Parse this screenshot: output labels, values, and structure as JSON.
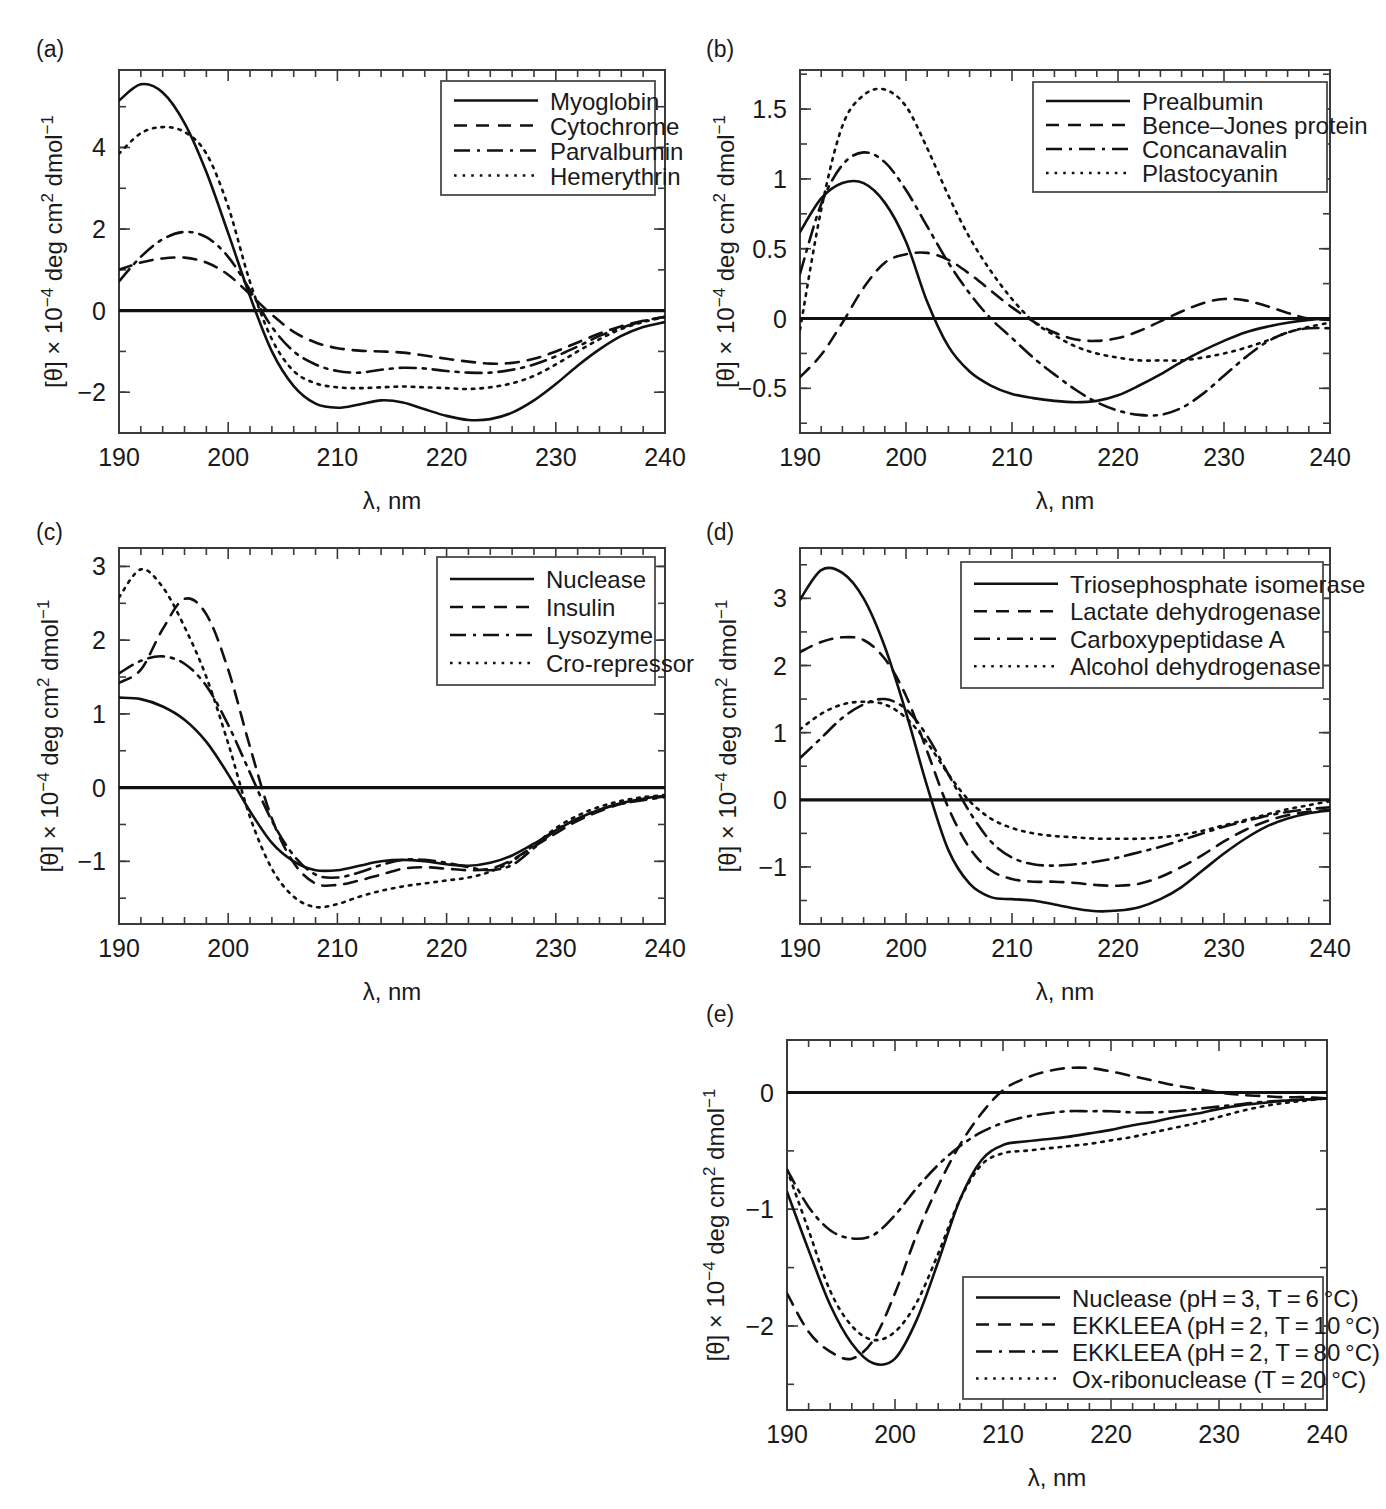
{
  "figure": {
    "axis": {
      "xlabel": "λ, nm",
      "ylabel_prefix": "[θ] × 10",
      "ylabel_exp": "−4",
      "ylabel_suffix": " deg cm",
      "ylabel_sq": "2",
      "ylabel_tail": " dmol",
      "ylabel_tailexp": "−1",
      "xticks": [
        "190",
        "200",
        "210",
        "220",
        "230",
        "240"
      ],
      "xlim": [
        190,
        240
      ]
    },
    "panels": [
      {
        "tag": "(a)",
        "yticks": [
          "4",
          "2",
          "0",
          "−2"
        ],
        "ytickvals": [
          4,
          2,
          0,
          -2
        ],
        "ylim": [
          -3.0,
          5.9
        ],
        "legend": [
          {
            "label": "Myoglobin",
            "style": "solid"
          },
          {
            "label": "Cytochrome",
            "style": "dashed"
          },
          {
            "label": "Parvalbumin",
            "style": "dashdot"
          },
          {
            "label": "Hemerythrin",
            "style": "dotted"
          }
        ]
      },
      {
        "tag": "(b)",
        "yticks": [
          "1.5",
          "1",
          "0.5",
          "0",
          "−0.5"
        ],
        "ytickvals": [
          1.5,
          1,
          0.5,
          0,
          -0.5
        ],
        "ylim": [
          -0.82,
          1.78
        ],
        "legend": [
          {
            "label": "Prealbumin",
            "style": "solid"
          },
          {
            "label": "Bence–Jones protein",
            "style": "dashed"
          },
          {
            "label": "Concanavalin",
            "style": "dashdot"
          },
          {
            "label": "Plastocyanin",
            "style": "dotted"
          }
        ]
      },
      {
        "tag": "(c)",
        "yticks": [
          "3",
          "2",
          "1",
          "0",
          "−1"
        ],
        "ytickvals": [
          3,
          2,
          1,
          0,
          -1
        ],
        "ylim": [
          -1.85,
          3.25
        ],
        "legend": [
          {
            "label": "Nuclease",
            "style": "solid"
          },
          {
            "label": "Insulin",
            "style": "dashed"
          },
          {
            "label": "Lysozyme",
            "style": "dashdot"
          },
          {
            "label": "Cro-repressor",
            "style": "dotted"
          }
        ]
      },
      {
        "tag": "(d)",
        "yticks": [
          "3",
          "2",
          "1",
          "0",
          "−1"
        ],
        "ytickvals": [
          3,
          2,
          1,
          0,
          -1
        ],
        "ylim": [
          -1.85,
          3.75
        ],
        "legend": [
          {
            "label": "Triosephosphate isomerase",
            "style": "solid"
          },
          {
            "label": "Lactate dehydrogenase",
            "style": "dashed"
          },
          {
            "label": "Carboxypeptidase A",
            "style": "dashdot"
          },
          {
            "label": "Alcohol dehydrogenase",
            "style": "dotted"
          }
        ]
      },
      {
        "tag": "(e)",
        "yticks": [
          "0",
          "−1",
          "−2"
        ],
        "ytickvals": [
          0,
          -1,
          -2
        ],
        "ylim": [
          -2.72,
          0.45
        ],
        "legend": [
          {
            "label": "Nuclease (pH = 3, T = 6 °C)",
            "style": "solid"
          },
          {
            "label": "EKKLEEA (pH = 2, T = 10 °C)",
            "style": "dashed"
          },
          {
            "label": "EKKLEEA (pH = 2, T = 80 °C)",
            "style": "dashdot"
          },
          {
            "label": "Ox-ribonuclease (T = 20 °C)",
            "style": "dotted"
          }
        ]
      }
    ]
  },
  "chart_data": [
    {
      "type": "line",
      "panel": "(a)",
      "title": "",
      "xlabel": "λ, nm",
      "ylabel": "[θ] × 10⁻⁴ deg cm² dmol⁻¹",
      "xlim": [
        190,
        240
      ],
      "ylim": [
        -3.0,
        5.9
      ],
      "grid": false,
      "legend_position": "top-right",
      "x": [
        190,
        192,
        194,
        196,
        198,
        200,
        202,
        204,
        206,
        208,
        210,
        212,
        214,
        216,
        218,
        220,
        222,
        224,
        226,
        228,
        230,
        232,
        234,
        236,
        238,
        240
      ],
      "series": [
        {
          "name": "Myoglobin",
          "style": "solid",
          "values": [
            5.15,
            5.55,
            5.35,
            4.6,
            3.4,
            1.9,
            0.35,
            -1.0,
            -1.85,
            -2.28,
            -2.38,
            -2.3,
            -2.2,
            -2.25,
            -2.42,
            -2.58,
            -2.68,
            -2.66,
            -2.5,
            -2.2,
            -1.8,
            -1.35,
            -0.95,
            -0.62,
            -0.4,
            -0.28
          ]
        },
        {
          "name": "Cytochrome",
          "style": "dashed",
          "values": [
            1.0,
            1.18,
            1.28,
            1.3,
            1.18,
            0.88,
            0.4,
            -0.1,
            -0.52,
            -0.78,
            -0.92,
            -0.98,
            -1.0,
            -1.03,
            -1.1,
            -1.18,
            -1.25,
            -1.3,
            -1.28,
            -1.18,
            -1.0,
            -0.78,
            -0.56,
            -0.38,
            -0.25,
            -0.15
          ]
        },
        {
          "name": "Parvalbumin",
          "style": "dashdot",
          "values": [
            0.72,
            1.32,
            1.75,
            1.93,
            1.8,
            1.32,
            0.5,
            -0.4,
            -1.0,
            -1.32,
            -1.48,
            -1.52,
            -1.45,
            -1.4,
            -1.42,
            -1.48,
            -1.52,
            -1.52,
            -1.45,
            -1.32,
            -1.12,
            -0.88,
            -0.62,
            -0.42,
            -0.26,
            -0.15
          ]
        },
        {
          "name": "Hemerythrin",
          "style": "dotted",
          "values": [
            3.85,
            4.35,
            4.5,
            4.38,
            3.85,
            2.55,
            0.7,
            -0.7,
            -1.48,
            -1.78,
            -1.88,
            -1.9,
            -1.88,
            -1.86,
            -1.88,
            -1.9,
            -1.92,
            -1.88,
            -1.78,
            -1.6,
            -1.32,
            -1.0,
            -0.7,
            -0.45,
            -0.28,
            -0.16
          ]
        }
      ]
    },
    {
      "type": "line",
      "panel": "(b)",
      "xlabel": "λ, nm",
      "ylabel": "[θ] × 10⁻⁴ deg cm² dmol⁻¹",
      "xlim": [
        190,
        240
      ],
      "ylim": [
        -0.82,
        1.78
      ],
      "grid": false,
      "legend_position": "top-right",
      "x": [
        190,
        192,
        194,
        196,
        198,
        200,
        202,
        204,
        206,
        208,
        210,
        212,
        214,
        216,
        218,
        220,
        222,
        224,
        226,
        228,
        230,
        232,
        234,
        236,
        238,
        240
      ],
      "series": [
        {
          "name": "Prealbumin",
          "style": "solid",
          "values": [
            0.62,
            0.86,
            0.97,
            0.97,
            0.83,
            0.55,
            0.12,
            -0.2,
            -0.38,
            -0.48,
            -0.54,
            -0.57,
            -0.59,
            -0.6,
            -0.59,
            -0.55,
            -0.48,
            -0.4,
            -0.31,
            -0.23,
            -0.16,
            -0.1,
            -0.06,
            -0.03,
            -0.01,
            0.0
          ]
        },
        {
          "name": "Bence–Jones protein",
          "style": "dashed",
          "values": [
            -0.42,
            -0.26,
            -0.03,
            0.22,
            0.4,
            0.46,
            0.47,
            0.42,
            0.32,
            0.2,
            0.08,
            -0.02,
            -0.1,
            -0.15,
            -0.16,
            -0.14,
            -0.09,
            -0.02,
            0.05,
            0.11,
            0.14,
            0.13,
            0.09,
            0.04,
            0.0,
            -0.01
          ]
        },
        {
          "name": "Concanavalin",
          "style": "dashdot",
          "values": [
            0.32,
            0.82,
            1.1,
            1.19,
            1.12,
            0.92,
            0.66,
            0.4,
            0.18,
            0.0,
            -0.14,
            -0.28,
            -0.4,
            -0.51,
            -0.6,
            -0.66,
            -0.69,
            -0.69,
            -0.64,
            -0.54,
            -0.41,
            -0.28,
            -0.17,
            -0.1,
            -0.07,
            -0.07
          ]
        },
        {
          "name": "Plastocyanin",
          "style": "dotted",
          "values": [
            -0.08,
            0.78,
            1.38,
            1.6,
            1.64,
            1.52,
            1.22,
            0.88,
            0.58,
            0.34,
            0.14,
            -0.02,
            -0.12,
            -0.2,
            -0.25,
            -0.28,
            -0.3,
            -0.3,
            -0.3,
            -0.28,
            -0.25,
            -0.21,
            -0.16,
            -0.1,
            -0.06,
            -0.03
          ]
        }
      ]
    },
    {
      "type": "line",
      "panel": "(c)",
      "xlabel": "λ, nm",
      "ylabel": "[θ] × 10⁻⁴ deg cm² dmol⁻¹",
      "xlim": [
        190,
        240
      ],
      "ylim": [
        -1.85,
        3.25
      ],
      "grid": false,
      "legend_position": "top-right",
      "x": [
        190,
        192,
        194,
        196,
        198,
        200,
        202,
        204,
        206,
        208,
        210,
        212,
        214,
        216,
        218,
        220,
        222,
        224,
        226,
        228,
        230,
        232,
        234,
        236,
        238,
        240
      ],
      "series": [
        {
          "name": "Nuclease",
          "style": "solid",
          "values": [
            1.22,
            1.2,
            1.1,
            0.92,
            0.62,
            0.18,
            -0.32,
            -0.75,
            -1.0,
            -1.12,
            -1.12,
            -1.06,
            -1.0,
            -0.98,
            -1.0,
            -1.04,
            -1.06,
            -1.02,
            -0.92,
            -0.76,
            -0.58,
            -0.42,
            -0.3,
            -0.21,
            -0.15,
            -0.11
          ]
        },
        {
          "name": "Insulin",
          "style": "dashed",
          "values": [
            1.42,
            1.6,
            2.15,
            2.56,
            2.35,
            1.6,
            0.55,
            -0.42,
            -1.02,
            -1.3,
            -1.32,
            -1.26,
            -1.18,
            -1.1,
            -1.08,
            -1.1,
            -1.12,
            -1.1,
            -0.98,
            -0.8,
            -0.62,
            -0.45,
            -0.32,
            -0.22,
            -0.16,
            -0.12
          ]
        },
        {
          "name": "Lysozyme",
          "style": "dashdot",
          "values": [
            1.55,
            1.72,
            1.78,
            1.68,
            1.38,
            0.85,
            0.2,
            -0.45,
            -0.92,
            -1.18,
            -1.22,
            -1.15,
            -1.05,
            -0.98,
            -0.98,
            -1.02,
            -1.08,
            -1.12,
            -1.05,
            -0.82,
            -0.58,
            -0.42,
            -0.3,
            -0.22,
            -0.17,
            -0.13
          ]
        },
        {
          "name": "Cro-repressor",
          "style": "dotted",
          "values": [
            2.58,
            2.96,
            2.72,
            2.18,
            1.5,
            0.6,
            -0.4,
            -1.1,
            -1.48,
            -1.62,
            -1.58,
            -1.48,
            -1.4,
            -1.34,
            -1.3,
            -1.26,
            -1.22,
            -1.14,
            -1.0,
            -0.78,
            -0.55,
            -0.38,
            -0.26,
            -0.18,
            -0.13,
            -0.1
          ]
        }
      ]
    },
    {
      "type": "line",
      "panel": "(d)",
      "xlabel": "λ, nm",
      "ylabel": "[θ] × 10⁻⁴ deg cm² dmol⁻¹",
      "xlim": [
        190,
        240
      ],
      "ylim": [
        -1.85,
        3.75
      ],
      "grid": false,
      "legend_position": "top-right",
      "x": [
        190,
        192,
        194,
        196,
        198,
        200,
        202,
        204,
        206,
        208,
        210,
        212,
        214,
        216,
        218,
        220,
        222,
        224,
        226,
        228,
        230,
        232,
        234,
        236,
        238,
        240
      ],
      "series": [
        {
          "name": "Triosephosphate isomerase",
          "style": "solid",
          "values": [
            2.98,
            3.42,
            3.38,
            3.0,
            2.28,
            1.3,
            0.2,
            -0.75,
            -1.25,
            -1.45,
            -1.48,
            -1.5,
            -1.56,
            -1.62,
            -1.66,
            -1.65,
            -1.6,
            -1.48,
            -1.3,
            -1.05,
            -0.8,
            -0.58,
            -0.4,
            -0.28,
            -0.2,
            -0.16
          ]
        },
        {
          "name": "Lactate dehydrogenase",
          "style": "dashed",
          "values": [
            2.2,
            2.35,
            2.42,
            2.38,
            2.1,
            1.55,
            0.72,
            -0.12,
            -0.72,
            -1.05,
            -1.18,
            -1.22,
            -1.22,
            -1.24,
            -1.27,
            -1.28,
            -1.25,
            -1.15,
            -1.0,
            -0.82,
            -0.62,
            -0.45,
            -0.32,
            -0.23,
            -0.18,
            -0.15
          ]
        },
        {
          "name": "Carboxypeptidase A",
          "style": "dashdot",
          "values": [
            0.62,
            0.92,
            1.22,
            1.42,
            1.5,
            1.35,
            0.95,
            0.38,
            -0.18,
            -0.62,
            -0.86,
            -0.96,
            -0.98,
            -0.96,
            -0.92,
            -0.86,
            -0.78,
            -0.7,
            -0.6,
            -0.5,
            -0.4,
            -0.32,
            -0.24,
            -0.18,
            -0.14,
            -0.11
          ]
        },
        {
          "name": "Alcohol dehydrogenase",
          "style": "dotted",
          "values": [
            1.05,
            1.28,
            1.42,
            1.46,
            1.42,
            1.22,
            0.85,
            0.38,
            -0.02,
            -0.28,
            -0.42,
            -0.5,
            -0.54,
            -0.56,
            -0.58,
            -0.58,
            -0.58,
            -0.56,
            -0.52,
            -0.46,
            -0.38,
            -0.3,
            -0.22,
            -0.14,
            -0.08,
            -0.02
          ]
        }
      ]
    },
    {
      "type": "line",
      "panel": "(e)",
      "xlabel": "λ, nm",
      "ylabel": "[θ] × 10⁻⁴ deg cm² dmol⁻¹",
      "xlim": [
        190,
        240
      ],
      "ylim": [
        -2.72,
        0.45
      ],
      "grid": false,
      "legend_position": "bottom-right",
      "x": [
        190,
        192,
        194,
        196,
        198,
        200,
        202,
        204,
        206,
        208,
        210,
        212,
        214,
        216,
        218,
        220,
        222,
        224,
        226,
        228,
        230,
        232,
        234,
        236,
        238,
        240
      ],
      "series": [
        {
          "name": "Nuclease (pH = 3, T = 6 °C)",
          "style": "solid",
          "values": [
            -0.85,
            -1.35,
            -1.82,
            -2.15,
            -2.32,
            -2.28,
            -1.95,
            -1.45,
            -0.92,
            -0.58,
            -0.45,
            -0.42,
            -0.4,
            -0.38,
            -0.35,
            -0.32,
            -0.28,
            -0.25,
            -0.21,
            -0.18,
            -0.14,
            -0.11,
            -0.09,
            -0.07,
            -0.06,
            -0.05
          ]
        },
        {
          "name": "EKKLEEA (pH = 2, T = 10 °C)",
          "style": "dashed",
          "values": [
            -1.72,
            -2.05,
            -2.22,
            -2.28,
            -2.12,
            -1.72,
            -1.22,
            -0.8,
            -0.45,
            -0.18,
            0.02,
            0.12,
            0.18,
            0.21,
            0.21,
            0.18,
            0.14,
            0.1,
            0.06,
            0.03,
            0.0,
            -0.02,
            -0.03,
            -0.04,
            -0.04,
            -0.05
          ]
        },
        {
          "name": "EKKLEEA (pH = 2, T = 80 °C)",
          "style": "dashdot",
          "values": [
            -0.66,
            -0.98,
            -1.18,
            -1.25,
            -1.22,
            -1.05,
            -0.82,
            -0.62,
            -0.46,
            -0.34,
            -0.26,
            -0.21,
            -0.18,
            -0.16,
            -0.16,
            -0.16,
            -0.17,
            -0.17,
            -0.16,
            -0.14,
            -0.12,
            -0.1,
            -0.08,
            -0.07,
            -0.06,
            -0.05
          ]
        },
        {
          "name": "Ox-ribonuclease (T = 20 °C)",
          "style": "dotted",
          "values": [
            -0.66,
            -1.18,
            -1.7,
            -2.0,
            -2.12,
            -2.05,
            -1.8,
            -1.38,
            -0.92,
            -0.62,
            -0.52,
            -0.5,
            -0.48,
            -0.46,
            -0.44,
            -0.41,
            -0.38,
            -0.34,
            -0.3,
            -0.26,
            -0.21,
            -0.16,
            -0.12,
            -0.09,
            -0.07,
            -0.05
          ]
        }
      ]
    }
  ]
}
